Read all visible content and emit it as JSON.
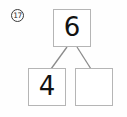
{
  "problem": {
    "number": "17",
    "badge_icon": "circled-number-icon",
    "type": "number-bond"
  },
  "number_bond": {
    "whole": {
      "label": "6",
      "name": "whole-box"
    },
    "parts": [
      {
        "label": "4",
        "name": "part-box-left",
        "filled": true
      },
      {
        "label": "",
        "name": "part-box-right",
        "filled": false
      }
    ]
  },
  "colors": {
    "box_border": "#b5b5b5",
    "digit": "#121212",
    "connector": "#8a8a8a",
    "badge_border": "#3a3a3a",
    "background": "#fefefe"
  }
}
